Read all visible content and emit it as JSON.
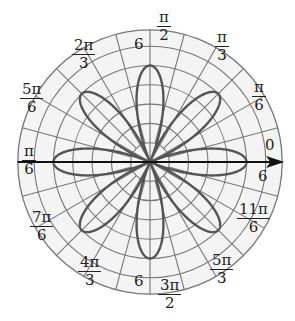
{
  "diagram": {
    "type": "polar_graph",
    "curve": "r = 5 cos(4θ)",
    "petals": 8,
    "petal_length": 5,
    "center": [
      150,
      162
    ],
    "unit_px": 19.3,
    "rings": 6,
    "outer_radius_units": 6.85,
    "spoke_step_deg": 15,
    "colors": {
      "grid": "#777777",
      "curve": "#555555",
      "axis": "#111111",
      "background": "#f4f4f4"
    }
  },
  "angle_labels": [
    {
      "id": "0",
      "num": "0",
      "den": "",
      "x": 263,
      "y": 138
    },
    {
      "id": "pi_6",
      "num": "π",
      "den": "6",
      "x": 252,
      "y": 80
    },
    {
      "id": "pi_3",
      "num": "π",
      "den": "3",
      "x": 215,
      "y": 30
    },
    {
      "id": "pi_2",
      "num": "π",
      "den": "2",
      "x": 157,
      "y": 10
    },
    {
      "id": "2pi_3",
      "num": "2π",
      "den": "3",
      "x": 72,
      "y": 38
    },
    {
      "id": "5pi_6",
      "num": "5π",
      "den": "6",
      "x": 20,
      "y": 82
    },
    {
      "id": "pi",
      "num": "π",
      "den": "6",
      "x": 22,
      "y": 144
    },
    {
      "id": "7pi_6",
      "num": "7π",
      "den": "6",
      "x": 30,
      "y": 210
    },
    {
      "id": "4pi_3",
      "num": "4π",
      "den": "3",
      "x": 78,
      "y": 255
    },
    {
      "id": "3pi_2",
      "num": "3π",
      "den": "2",
      "x": 158,
      "y": 278
    },
    {
      "id": "5pi_3",
      "num": "5π",
      "den": "3",
      "x": 210,
      "y": 253
    },
    {
      "id": "11pi_6",
      "num": "11π",
      "den": "6",
      "x": 237,
      "y": 202
    }
  ],
  "radius_labels": [
    {
      "text": "6",
      "x": 134,
      "y": 35
    },
    {
      "text": "6",
      "x": 134,
      "y": 272
    }
  ],
  "zero_sub": {
    "text": "6",
    "x": 258,
    "y": 167
  }
}
